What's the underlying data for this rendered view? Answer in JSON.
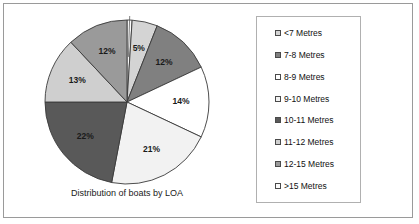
{
  "frame": {
    "border_color": "#9a9a9a",
    "background": "#ffffff"
  },
  "caption": "Distribution of boats by LOA",
  "legend": {
    "border_color": "#b0b0b0",
    "items": [
      {
        "label": "<7 Metres",
        "color": "#d4d4d4",
        "percent": 5
      },
      {
        "label": "7-8 Metres",
        "color": "#808080",
        "percent": 12
      },
      {
        "label": "8-9 Metres",
        "color": "#ffffff",
        "percent": 14
      },
      {
        "label": "9-10 Metres",
        "color": "#f2f2f2",
        "percent": 21
      },
      {
        "label": "10-11 Metres",
        "color": "#595959",
        "percent": 22
      },
      {
        "label": "11-12 Metres",
        "color": "#cfcfcf",
        "percent": 13
      },
      {
        "label": "12-15 Metres",
        "color": "#9a9a9a",
        "percent": 12
      },
      {
        "label": ">15 Metres",
        "color": "#fbfbfb",
        "percent": 1
      }
    ]
  },
  "chart_data": {
    "type": "pie",
    "title": "Distribution of boats by LOA",
    "xlabel": "",
    "ylabel": "",
    "legend_position": "right",
    "grid": false,
    "start_angle_deg": 0,
    "direction": "clockwise",
    "categories": [
      "<7 Metres",
      "7-8 Metres",
      "8-9 Metres",
      "9-10 Metres",
      "10-11 Metres",
      "11-12 Metres",
      "12-15 Metres",
      ">15 Metres"
    ],
    "values": [
      5,
      12,
      14,
      21,
      22,
      13,
      12,
      1
    ],
    "unit": "percent",
    "total": 100,
    "data_labels": [
      "5%",
      "12%",
      "14%",
      "21%",
      "22%",
      "13%",
      "12%",
      "1%"
    ],
    "colors": [
      "#d4d4d4",
      "#808080",
      "#ffffff",
      "#f2f2f2",
      "#595959",
      "#cfcfcf",
      "#9a9a9a",
      "#fbfbfb"
    ],
    "slice_order_clockwise_from_top": [
      {
        "label": ">15 Metres",
        "percent": 1,
        "data_label": "1%",
        "color": "#fbfbfb"
      },
      {
        "label": "<7 Metres",
        "percent": 5,
        "data_label": "5%",
        "color": "#d4d4d4"
      },
      {
        "label": "7-8 Metres",
        "percent": 12,
        "data_label": "12%",
        "color": "#808080"
      },
      {
        "label": "8-9 Metres",
        "percent": 14,
        "data_label": "14%",
        "color": "#ffffff"
      },
      {
        "label": "9-10 Metres",
        "percent": 21,
        "data_label": "21%",
        "color": "#f2f2f2"
      },
      {
        "label": "10-11 Metres",
        "percent": 22,
        "data_label": "22%",
        "color": "#595959"
      },
      {
        "label": "11-12 Metres",
        "percent": 13,
        "data_label": "13%",
        "color": "#cfcfcf"
      },
      {
        "label": "12-15 Metres",
        "percent": 12,
        "data_label": "12%",
        "color": "#9a9a9a"
      }
    ]
  }
}
